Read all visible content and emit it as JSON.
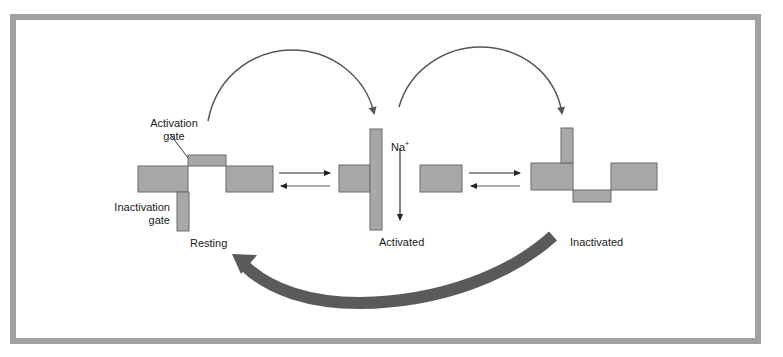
{
  "diagram": {
    "states": [
      {
        "id": "resting",
        "label": "Resting"
      },
      {
        "id": "activated",
        "label": "Activated"
      },
      {
        "id": "inactivated",
        "label": "Inactivated"
      }
    ],
    "annotations": {
      "activation_gate_line1": "Activation",
      "activation_gate_line2": "gate",
      "inactivation_gate_line1": "Inactivation",
      "inactivation_gate_line2": "gate",
      "ion": "Na",
      "ion_charge": "+"
    },
    "colors": {
      "border": "#a0a0a0",
      "membrane": "#a8a8a8",
      "membrane_stroke": "#6a6a6a",
      "arrow": "#555555",
      "big_arrow": "#5a5a5a"
    }
  }
}
